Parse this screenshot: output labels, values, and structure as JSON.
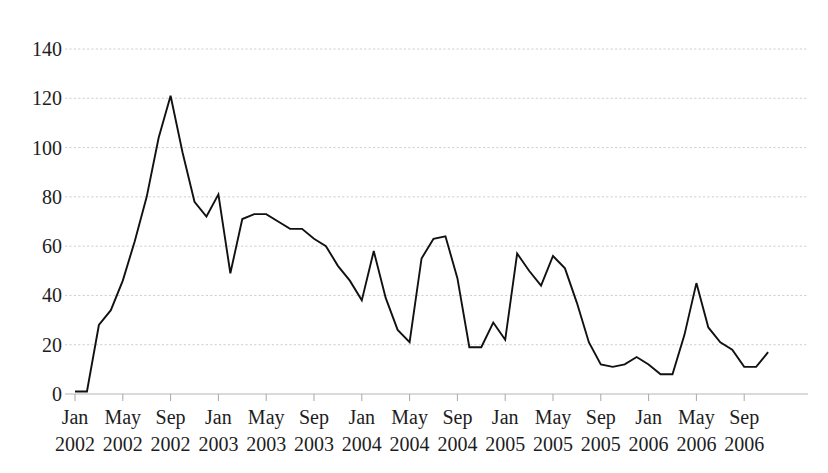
{
  "chart_data": {
    "type": "line",
    "title": "",
    "subtitle": "",
    "xlabel": "",
    "ylabel": "",
    "ylim": [
      0,
      140
    ],
    "yticks": [
      0,
      20,
      40,
      60,
      80,
      100,
      120,
      140
    ],
    "ytick_labels": [
      "0",
      "20",
      "40",
      "60",
      "80",
      "100",
      "120",
      "140"
    ],
    "grid": true,
    "legend": false,
    "legend_position": "none",
    "xtick_labels": [
      {
        "month": "Jan",
        "year": "2002"
      },
      {
        "month": "May",
        "year": "2002"
      },
      {
        "month": "Sep",
        "year": "2002"
      },
      {
        "month": "Jan",
        "year": "2003"
      },
      {
        "month": "May",
        "year": "2003"
      },
      {
        "month": "Sep",
        "year": "2003"
      },
      {
        "month": "Jan",
        "year": "2004"
      },
      {
        "month": "May",
        "year": "2004"
      },
      {
        "month": "Sep",
        "year": "2004"
      },
      {
        "month": "Jan",
        "year": "2005"
      },
      {
        "month": "May",
        "year": "2005"
      },
      {
        "month": "Sep",
        "year": "2005"
      },
      {
        "month": "Jan",
        "year": "2006"
      },
      {
        "month": "May",
        "year": "2006"
      },
      {
        "month": "Sep",
        "year": "2006"
      }
    ],
    "x": [
      "Jan 2002",
      "Feb 2002",
      "Mar 2002",
      "Apr 2002",
      "May 2002",
      "Jun 2002",
      "Jul 2002",
      "Aug 2002",
      "Sep 2002",
      "Oct 2002",
      "Nov 2002",
      "Dec 2002",
      "Jan 2003",
      "Feb 2003",
      "Mar 2003",
      "Apr 2003",
      "May 2003",
      "Jun 2003",
      "Jul 2003",
      "Aug 2003",
      "Sep 2003",
      "Oct 2003",
      "Nov 2003",
      "Dec 2003",
      "Jan 2004",
      "Feb 2004",
      "Mar 2004",
      "Apr 2004",
      "May 2004",
      "Jun 2004",
      "Jul 2004",
      "Aug 2004",
      "Sep 2004",
      "Oct 2004",
      "Nov 2004",
      "Dec 2004",
      "Jan 2005",
      "Feb 2005",
      "Mar 2005",
      "Apr 2005",
      "May 2005",
      "Jun 2005",
      "Jul 2005",
      "Aug 2005",
      "Sep 2005",
      "Oct 2005",
      "Nov 2005",
      "Dec 2005",
      "Jan 2006",
      "Feb 2006",
      "Mar 2006",
      "Apr 2006",
      "May 2006",
      "Jun 2006",
      "Jul 2006",
      "Aug 2006",
      "Sep 2006",
      "Oct 2006",
      "Nov 2006"
    ],
    "values": [
      1,
      1,
      28,
      34,
      46,
      62,
      80,
      104,
      121,
      98,
      78,
      72,
      81,
      49,
      71,
      73,
      73,
      70,
      67,
      67,
      63,
      60,
      52,
      46,
      38,
      58,
      39,
      26,
      21,
      55,
      63,
      64,
      47,
      19,
      19,
      29,
      22,
      57,
      50,
      44,
      56,
      51,
      37,
      21,
      12,
      11,
      12,
      15,
      12,
      8,
      8,
      24,
      45,
      27,
      21,
      18,
      11,
      11,
      17
    ],
    "series": [
      {
        "name": "series-1",
        "color": "#111111",
        "values": [
          1,
          1,
          28,
          34,
          46,
          62,
          80,
          104,
          121,
          98,
          78,
          72,
          81,
          49,
          71,
          73,
          73,
          70,
          67,
          67,
          63,
          60,
          52,
          46,
          38,
          58,
          39,
          26,
          21,
          55,
          63,
          64,
          47,
          19,
          19,
          29,
          22,
          57,
          50,
          44,
          56,
          51,
          37,
          21,
          12,
          11,
          12,
          15,
          12,
          8,
          8,
          24,
          45,
          27,
          21,
          18,
          11,
          11,
          17
        ]
      }
    ],
    "peak": {
      "label": "Sep 2002",
      "value": 121
    },
    "minimum": {
      "label": "Jan 2002",
      "value": 1
    },
    "colors": {
      "line": "#111111",
      "grid": "#c9c9c9",
      "text": "#1d1d1d",
      "background": "#ffffff"
    }
  },
  "geometry": {
    "plot_left": 75,
    "plot_right": 808,
    "y_zero_px": 394,
    "y_top_px": 49,
    "y_top_value": 140,
    "month_step_px": 11.95
  }
}
